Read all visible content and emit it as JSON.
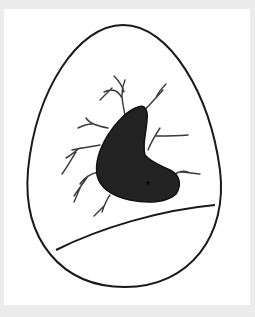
{
  "image": {
    "description": "Hand-drawn sketch of an egg containing a dark kidney-shaped mass with branching vein-like lines and a curved line across the lower portion",
    "colors": {
      "background_border": "#ececec",
      "paper": "#ffffff",
      "ink": "#1a1a1a",
      "mass_fill": "#232323",
      "vein": "#3a3a3a"
    },
    "elements": [
      "egg-outline",
      "dark-mass",
      "veins",
      "horizon-curve",
      "dot"
    ]
  }
}
